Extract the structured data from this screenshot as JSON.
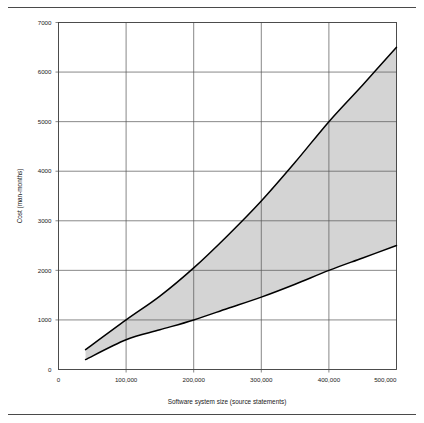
{
  "figure": {
    "name": "software-cost-estimation-chart",
    "background_color": "#ffffff",
    "rule_color": "#4a4a4a"
  },
  "chart_data": {
    "type": "area",
    "title": "",
    "subtitle": "",
    "xlabel": "Software system size (source statements)",
    "ylabel": "Cost (man-months)",
    "xlim": [
      0,
      500000
    ],
    "ylim": [
      0,
      7000
    ],
    "grid": true,
    "legend": "none",
    "x_tick_labels": [
      "0",
      "100,000",
      "200,000",
      "300,000",
      "400,000",
      "500,000"
    ],
    "x_tick_values": [
      0,
      100000,
      200000,
      300000,
      400000,
      500000
    ],
    "y_tick_labels": [
      "0",
      "1000",
      "2000",
      "3000",
      "4000",
      "5000",
      "6000",
      "7000"
    ],
    "y_tick_values": [
      0,
      1000,
      2000,
      3000,
      4000,
      5000,
      6000,
      7000
    ],
    "x": [
      40000,
      100000,
      150000,
      200000,
      250000,
      300000,
      350000,
      400000,
      450000,
      500000
    ],
    "series": [
      {
        "name": "Upper bound (pessimistic cost)",
        "values": [
          400,
          1000,
          1480,
          2050,
          2700,
          3400,
          4180,
          5000,
          5740,
          6500
        ],
        "line_color": "#000000"
      },
      {
        "name": "Lower bound (optimistic cost)",
        "values": [
          200,
          600,
          800,
          1000,
          1230,
          1460,
          1720,
          2000,
          2250,
          2500
        ],
        "line_color": "#000000"
      }
    ],
    "band": {
      "name": "Cost uncertainty range",
      "fill_color": "#d4d4d4"
    },
    "annotations": []
  }
}
